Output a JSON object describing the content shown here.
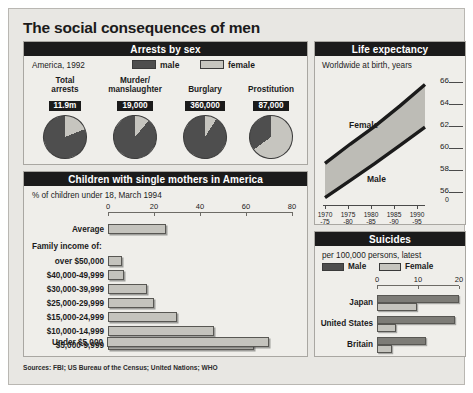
{
  "title": "The social consequences of men",
  "sources": "Sources: FBI; US Bureau of the Census; United Nations; WHO",
  "colors": {
    "male": "#4e4e4e",
    "female": "#c6c5bf",
    "header_bg": "#1b1b1b",
    "panel_bg": "#efeeea"
  },
  "arrests": {
    "heading": "Arrests by sex",
    "caption": "America, 1992",
    "legend": [
      {
        "key": "male",
        "label": "male"
      },
      {
        "key": "female",
        "label": "female"
      }
    ],
    "pies": [
      {
        "title": "Total\narrests",
        "title_line1": "Total",
        "title_line2": "arrests",
        "value": "11.9m",
        "male_pct": 81,
        "female_pct": 19
      },
      {
        "title_line1": "Murder/",
        "title_line2": "manslaughter",
        "value": "19,000",
        "male_pct": 89,
        "female_pct": 11
      },
      {
        "title_line1": "Burglary",
        "title_line2": "",
        "value": "360,000",
        "male_pct": 91,
        "female_pct": 9
      },
      {
        "title_line1": "Prostitution",
        "title_line2": "",
        "value": "87,000",
        "male_pct": 35,
        "female_pct": 65
      }
    ]
  },
  "life_expectancy": {
    "heading": "Life expectancy",
    "caption": "Worldwide at birth, years",
    "series_labels": {
      "female": "Female",
      "male": "Male"
    },
    "y_ticks": [
      "66",
      "64",
      "62",
      "60",
      "58",
      "56"
    ],
    "y_zero": "0",
    "x_ticks": [
      {
        "top": "1970",
        "bottom": "-75"
      },
      {
        "top": "1975",
        "bottom": "-80"
      },
      {
        "top": "1980",
        "bottom": "-85"
      },
      {
        "top": "1985",
        "bottom": "-90"
      },
      {
        "top": "1990",
        "bottom": "-95"
      }
    ]
  },
  "mothers": {
    "heading": "Children with single mothers in America",
    "caption": "% of children under 18, March 1994",
    "subheading": "Family income of:",
    "axis_ticks": [
      "0",
      "20",
      "40",
      "60",
      "80"
    ],
    "average_label": "Average",
    "rows": [
      {
        "label": "Average",
        "value": 25
      },
      {
        "label": "over $50,000",
        "value": 6
      },
      {
        "label": "$40,000-49,999",
        "value": 7
      },
      {
        "label": "$30,000-39,999",
        "value": 17
      },
      {
        "label": "$25,000-29,999",
        "value": 20
      },
      {
        "label": "$15,000-24,999",
        "value": 30
      },
      {
        "label": "$10,000-14,999",
        "value": 46
      },
      {
        "label": "$5,000-9,999",
        "value": 63
      },
      {
        "label": "Under $5,000",
        "value": 70
      }
    ]
  },
  "suicides": {
    "heading": "Suicides",
    "caption": "per 100,000 persons, latest",
    "legend": [
      {
        "key": "male",
        "label": "Male"
      },
      {
        "key": "female",
        "label": "Female"
      }
    ],
    "axis_ticks": [
      "0",
      "10",
      "20"
    ],
    "rows": [
      {
        "label": "Japan",
        "male": 20.0,
        "female": 9.8
      },
      {
        "label": "United States",
        "male": 19.0,
        "female": 4.6
      },
      {
        "label": "Britain",
        "male": 12.0,
        "female": 3.6
      }
    ]
  },
  "chart_data": [
    {
      "type": "pie",
      "title": "Arrests by sex",
      "subtitle": "America, 1992",
      "legend": [
        "male",
        "female"
      ],
      "charts": [
        {
          "name": "Total arrests",
          "total_label": "11.9m",
          "labels": [
            "male",
            "female"
          ],
          "values": [
            81,
            19
          ]
        },
        {
          "name": "Murder/manslaughter",
          "total_label": "19,000",
          "labels": [
            "male",
            "female"
          ],
          "values": [
            89,
            11
          ]
        },
        {
          "name": "Burglary",
          "total_label": "360,000",
          "labels": [
            "male",
            "female"
          ],
          "values": [
            91,
            9
          ]
        },
        {
          "name": "Prostitution",
          "total_label": "87,000",
          "labels": [
            "male",
            "female"
          ],
          "values": [
            35,
            65
          ]
        }
      ]
    },
    {
      "type": "area",
      "title": "Life expectancy",
      "subtitle": "Worldwide at birth, years",
      "xlabel": "",
      "ylabel": "years",
      "ylim": [
        55,
        67
      ],
      "yticks": [
        56,
        58,
        60,
        62,
        64,
        66
      ],
      "x": [
        "1970-75",
        "1975-80",
        "1980-85",
        "1985-90",
        "1990-95"
      ],
      "series": [
        {
          "name": "Female",
          "values": [
            58.8,
            60.6,
            62.3,
            64.2,
            66.2
          ]
        },
        {
          "name": "Male",
          "values": [
            55.6,
            57.2,
            58.8,
            60.5,
            62.2
          ]
        }
      ],
      "grid": false,
      "legend": "inline-annotations"
    },
    {
      "type": "bar",
      "orientation": "horizontal",
      "title": "Children with single mothers in America",
      "subtitle": "% of children under 18, March 1994",
      "xlabel": "%",
      "ylabel": "",
      "xlim": [
        0,
        80
      ],
      "xticks": [
        0,
        20,
        40,
        60,
        80
      ],
      "categories": [
        "Average",
        "over $50,000",
        "$40,000-49,999",
        "$30,000-39,999",
        "$25,000-29,999",
        "$15,000-24,999",
        "$10,000-14,999",
        "$5,000-9,999",
        "Under $5,000"
      ],
      "values": [
        25,
        6,
        7,
        17,
        20,
        30,
        46,
        63,
        70
      ],
      "grid": false
    },
    {
      "type": "bar",
      "orientation": "horizontal",
      "title": "Suicides",
      "subtitle": "per 100,000 persons, latest",
      "xlabel": "per 100,000 persons",
      "xlim": [
        0,
        20
      ],
      "xticks": [
        0,
        10,
        20
      ],
      "categories": [
        "Japan",
        "United States",
        "Britain"
      ],
      "series": [
        {
          "name": "Male",
          "values": [
            20.0,
            19.0,
            12.0
          ]
        },
        {
          "name": "Female",
          "values": [
            9.8,
            4.6,
            3.6
          ]
        }
      ],
      "legend": "top",
      "grid": false
    }
  ]
}
